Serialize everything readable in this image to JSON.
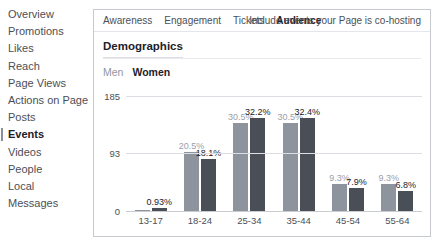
{
  "sidebar": {
    "items": [
      {
        "label": "Overview",
        "active": false
      },
      {
        "label": "Promotions",
        "active": false
      },
      {
        "label": "Likes",
        "active": false
      },
      {
        "label": "Reach",
        "active": false
      },
      {
        "label": "Page Views",
        "active": false
      },
      {
        "label": "Actions on Page",
        "active": false
      },
      {
        "label": "Posts",
        "active": false
      },
      {
        "label": "Events",
        "active": true
      },
      {
        "label": "Videos",
        "active": false
      },
      {
        "label": "People",
        "active": false
      },
      {
        "label": "Local",
        "active": false
      },
      {
        "label": "Messages",
        "active": false
      }
    ]
  },
  "panel": {
    "tabs": [
      {
        "label": "Awareness",
        "active": false
      },
      {
        "label": "Engagement",
        "active": false
      },
      {
        "label": "Tickets",
        "active": false
      },
      {
        "label": "Audience",
        "active": true
      }
    ],
    "cohost_note": "Include events your Page is co-hosting",
    "section_title": "Demographics",
    "legend": [
      {
        "label": "Men",
        "color": "#8e949e",
        "active": false
      },
      {
        "label": "Women",
        "color": "#4a4f57",
        "active": true
      }
    ],
    "footer_note": ""
  },
  "chart_data": {
    "type": "bar",
    "title": "Demographics",
    "xlabel": "",
    "ylabel": "",
    "ylim": [
      0,
      185
    ],
    "yticks": [
      0,
      93,
      185
    ],
    "grid": true,
    "legend_position": "top-left",
    "categories": [
      "13-17",
      "18-24",
      "25-34",
      "35-44",
      "45-54",
      "55-64"
    ],
    "series": [
      {
        "name": "Men",
        "color": "#8e949e",
        "values": [
          null,
          20.5,
          30.5,
          30.5,
          9.3,
          9.3
        ],
        "labels": [
          "",
          "20.5%",
          "30.5%",
          "30.5%",
          "9.3%",
          "9.3%"
        ]
      },
      {
        "name": "Women",
        "color": "#4a4f57",
        "values": [
          0.93,
          18.1,
          32.2,
          32.4,
          7.9,
          6.8
        ],
        "labels": [
          "0.93%",
          "18.1%",
          "32.2%",
          "32.4%",
          "7.9%",
          "6.8%"
        ]
      }
    ]
  }
}
